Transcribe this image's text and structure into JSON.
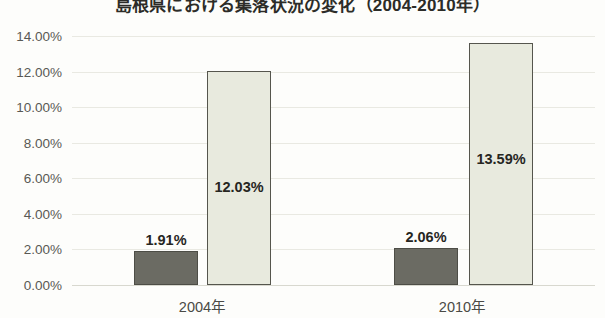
{
  "chart_data": {
    "type": "bar",
    "title": "島根県における集落状況の変化（2004-2010年）",
    "xlabel": "",
    "ylabel": "",
    "categories": [
      "2004年",
      "2010年"
    ],
    "series": [
      {
        "name": "series-dark",
        "color": "#6b6b63",
        "values": [
          1.91,
          2.06
        ],
        "labels": [
          "1.91%",
          "2.06%"
        ]
      },
      {
        "name": "series-light",
        "color": "#e8eade",
        "values": [
          12.03,
          13.59
        ],
        "labels": [
          "12.03%",
          "13.59%"
        ]
      }
    ],
    "ylim": [
      0,
      14
    ],
    "ytick_values": [
      14,
      12,
      10,
      8,
      6,
      4,
      2,
      0
    ],
    "ytick_labels": [
      "14.00%",
      "12.00%",
      "10.00%",
      "8.00%",
      "6.00%",
      "4.00%",
      "2.00%",
      "0.00%"
    ],
    "grid": true,
    "legend": "none"
  },
  "axis": {
    "y": {
      "ticks": [
        {
          "label": "14.00%",
          "value": 14
        },
        {
          "label": "12.00%",
          "value": 12
        },
        {
          "label": "10.00%",
          "value": 10
        },
        {
          "label": "8.00%",
          "value": 8
        },
        {
          "label": "6.00%",
          "value": 6
        },
        {
          "label": "4.00%",
          "value": 4
        },
        {
          "label": "2.00%",
          "value": 2
        },
        {
          "label": "0.00%",
          "value": 0
        }
      ]
    },
    "x": {
      "ticks": [
        {
          "label": "2004年"
        },
        {
          "label": "2010年"
        }
      ]
    }
  },
  "bars": [
    {
      "name": "bar-2004-dark",
      "value": 1.91,
      "label": "1.91%",
      "left": 62,
      "width": 64,
      "style": "dark"
    },
    {
      "name": "bar-2004-light",
      "value": 12.03,
      "label": "12.03%",
      "left": 135,
      "width": 64,
      "style": "light"
    },
    {
      "name": "bar-2010-dark",
      "value": 2.06,
      "label": "2.06%",
      "left": 322,
      "width": 64,
      "style": "dark"
    },
    {
      "name": "bar-2010-light",
      "value": 13.59,
      "label": "13.59%",
      "left": 397,
      "width": 64,
      "style": "light"
    }
  ],
  "xlabels": [
    {
      "label": "2004年",
      "left": 202
    },
    {
      "label": "2010年",
      "left": 462
    }
  ]
}
